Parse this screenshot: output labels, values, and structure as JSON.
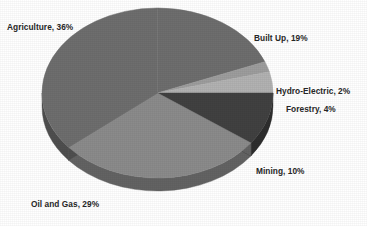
{
  "chart_data": {
    "type": "pie",
    "title": "",
    "subtitle": "",
    "xlabel": "",
    "ylabel": "",
    "legend_position": "none",
    "grid": false,
    "three_d": true,
    "label_format": "{name}, {value}%",
    "categories": [
      "Built Up",
      "Hydro-Electric",
      "Forestry",
      "Mining",
      "Oil and Gas",
      "Agriculture"
    ],
    "values": [
      19,
      2,
      4,
      10,
      29,
      36
    ],
    "units": "percent",
    "total": 100,
    "slices": [
      {
        "name": "Built Up",
        "value": 19,
        "label": "Built Up, 19%",
        "color": "#6e6e6e",
        "side_color": "#4f4f4f",
        "start_angle": 0,
        "end_angle": 68.4
      },
      {
        "name": "Hydro-Electric",
        "value": 2,
        "label": "Hydro-Electric, 2%",
        "color": "#9d9d9d",
        "side_color": "#727272",
        "start_angle": 68.4,
        "end_angle": 75.6
      },
      {
        "name": "Forestry",
        "value": 4,
        "label": "Forestry, 4%",
        "color": "#b2b2b2",
        "side_color": "#828282",
        "start_angle": 75.6,
        "end_angle": 90.0
      },
      {
        "name": "Mining",
        "value": 10,
        "label": "Mining, 10%",
        "color": "#414141",
        "side_color": "#2e2e2e",
        "start_angle": 90.0,
        "end_angle": 126.0
      },
      {
        "name": "Oil and Gas",
        "value": 29,
        "label": "Oil and Gas, 29%",
        "color": "#8b8b8b",
        "side_color": "#636363",
        "start_angle": 126.0,
        "end_angle": 230.4
      },
      {
        "name": "Agriculture",
        "value": 36,
        "label": "Agriculture, 36%",
        "color": "#6e6e6e",
        "side_color": "#4f4f4f",
        "start_angle": 230.4,
        "end_angle": 360.0
      }
    ]
  },
  "labels": {
    "agriculture": "Agriculture, 36%",
    "built_up": "Built Up, 19%",
    "hydro_electric": "Hydro-Electric, 2%",
    "forestry": "Forestry, 4%",
    "mining": "Mining, 10%",
    "oil_and_gas": "Oil and Gas, 29%"
  },
  "colors": {
    "background": "#ffffff",
    "label_text": "#262626",
    "agriculture": "#6e6e6e",
    "built_up": "#6e6e6e",
    "hydro_electric": "#9d9d9d",
    "forestry": "#b2b2b2",
    "mining": "#414141",
    "oil_and_gas": "#8b8b8b"
  }
}
